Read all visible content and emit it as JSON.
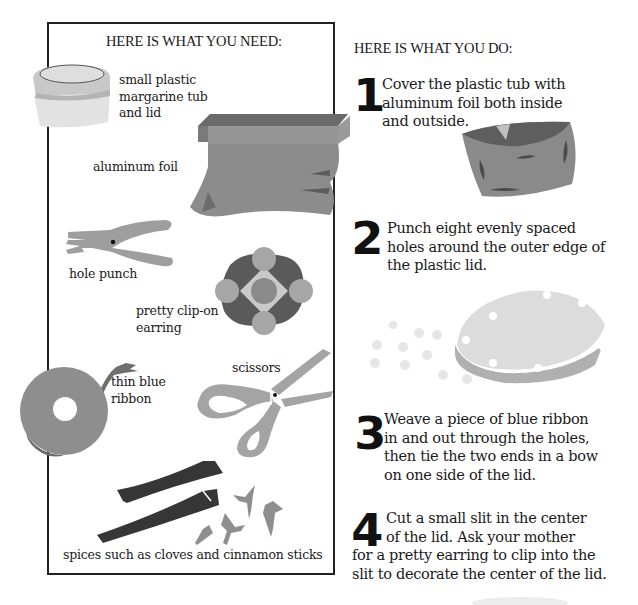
{
  "needs": {
    "heading": "HERE IS WHAT YOU NEED:",
    "items": [
      {
        "label_lines": [
          "small plastic",
          "margarine tub",
          "and lid"
        ],
        "icon": "margarine-tub-icon"
      },
      {
        "label_lines": [
          "aluminum foil"
        ],
        "icon": "aluminum-foil-icon"
      },
      {
        "label_lines": [
          "hole punch"
        ],
        "icon": "hole-punch-icon"
      },
      {
        "label_lines": [
          "pretty clip-on",
          "earring"
        ],
        "icon": "earring-icon"
      },
      {
        "label_lines": [
          "thin blue",
          "ribbon"
        ],
        "icon": "ribbon-spool-icon"
      },
      {
        "label_lines": [
          "scissors"
        ],
        "icon": "scissors-icon"
      },
      {
        "label_lines": [
          "spices such as cloves and cinnamon sticks"
        ],
        "icon": "spices-icon"
      }
    ]
  },
  "steps": {
    "heading": "HERE IS WHAT YOU DO:",
    "items": [
      {
        "number": "1",
        "lines": [
          "Cover the plastic tub with",
          "aluminum foil both inside",
          "and outside."
        ],
        "icon": "foil-covered-tub-icon"
      },
      {
        "number": "2",
        "lines": [
          "Punch eight evenly spaced",
          "holes around the outer edge of",
          "the plastic lid."
        ],
        "icon": "punched-lid-icon"
      },
      {
        "number": "3",
        "lines": [
          "Weave a piece of blue ribbon",
          "in and out through the holes,",
          "then tie the two ends in a bow",
          "on one side of the lid."
        ]
      },
      {
        "number": "4",
        "lines": [
          "Cut a small slit in the center",
          "of the lid. Ask your mother",
          "for a pretty earring to clip into the",
          "slit to decorate the center of the lid."
        ]
      }
    ]
  },
  "colors": {
    "text": "#1a1a1a",
    "border": "#222222",
    "gray_light": "#d4d4d4",
    "gray_mid": "#a8a8a8",
    "gray_dark": "#6e6e6e",
    "cinnamon": "#3a3a3a"
  }
}
